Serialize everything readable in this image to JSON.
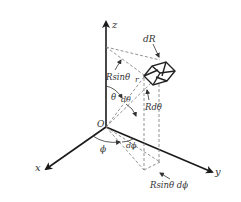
{
  "figure": {
    "axes": {
      "z": {
        "label": "z"
      },
      "x": {
        "label": "x"
      },
      "y": {
        "label": "y"
      },
      "origin": {
        "label": "O"
      }
    },
    "labels": {
      "dR": "dR",
      "r": "r",
      "Rsin_theta": "Rsinθ",
      "theta": "θ",
      "d_theta": "dθ",
      "R_d_theta": "Rdθ",
      "phi": "ϕ",
      "d_phi": "dϕ",
      "Rsin_theta_d_phi": "Rsinθ dϕ"
    },
    "colors": {
      "axis": "#1a1a1a",
      "dashed": "#777777",
      "text": "#333333",
      "background": "#ffffff"
    }
  }
}
